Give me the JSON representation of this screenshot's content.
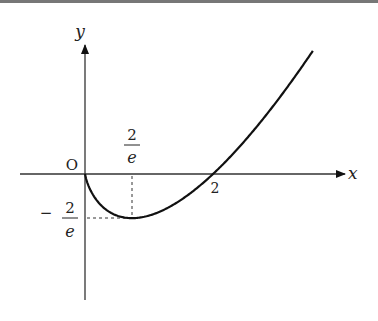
{
  "figure": {
    "axis_x_label": "x",
    "axis_y_label": "y",
    "origin_label": "O",
    "x_tick_2": "2",
    "x_tick_frac_num": "2",
    "x_tick_frac_den": "e",
    "y_tick_sign": "−",
    "y_tick_frac_num": "2",
    "y_tick_frac_den": "e",
    "function": "y = x ln(x/2)",
    "min_point": {
      "x": "2/e",
      "y": "-2/e"
    },
    "zero_crossing": 2
  }
}
